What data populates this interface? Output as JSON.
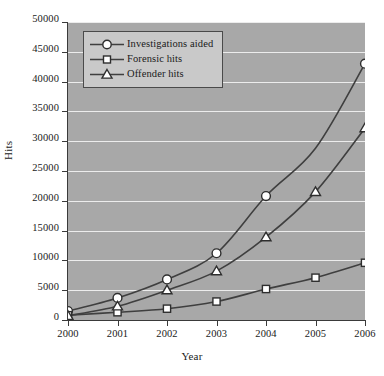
{
  "chart_data": {
    "type": "line",
    "title": "",
    "xlabel": "Year",
    "ylabel": "Hits",
    "x": [
      2000,
      2001,
      2002,
      2003,
      2004,
      2005,
      2006
    ],
    "xtick_labels": [
      "2000",
      "2001",
      "2002",
      "2003",
      "2004",
      "2005",
      "2006"
    ],
    "ytick_labels": [
      "0",
      "5000",
      "10000",
      "15000",
      "20000",
      "25000",
      "30000",
      "35000",
      "40000",
      "45000",
      "50000"
    ],
    "yticks": [
      0,
      5000,
      10000,
      15000,
      20000,
      25000,
      30000,
      35000,
      40000,
      45000,
      50000
    ],
    "ylim": [
      0,
      50000
    ],
    "xlim": [
      2000,
      2006
    ],
    "grid": "horizontal",
    "legend_position": "upper-left",
    "plot_background": "#a8a8a8",
    "gridline_color": "#efefef",
    "line_color": "#3f3f3f",
    "marker_fill": "#ffffff",
    "series": [
      {
        "name": "Investigations aided",
        "marker": "circle",
        "values": [
          1500,
          3700,
          6800,
          11200,
          20800,
          28800,
          43000
        ],
        "marker_shown": [
          true,
          true,
          true,
          true,
          true,
          false,
          true
        ]
      },
      {
        "name": "Forensic hits",
        "marker": "square",
        "values": [
          800,
          1300,
          1900,
          3100,
          5200,
          7100,
          9600
        ],
        "marker_shown": [
          true,
          true,
          true,
          true,
          true,
          true,
          true
        ]
      },
      {
        "name": "Offender hits",
        "marker": "triangle",
        "values": [
          700,
          2300,
          5000,
          8200,
          13900,
          21500,
          32200
        ],
        "marker_shown": [
          true,
          true,
          true,
          true,
          true,
          true,
          true
        ]
      }
    ]
  }
}
